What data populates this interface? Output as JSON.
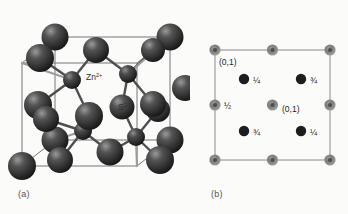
{
  "figure": {
    "background_color": "#fbfbfa"
  },
  "panel_a": {
    "caption": "(a)",
    "labels": {
      "cation": "Zn",
      "cation_charge": "2+",
      "anion": "S",
      "anion_charge": "2−"
    },
    "colors": {
      "sphere_dark": "#3a3a3a",
      "sphere_highlight": "#8e8e8e",
      "sphere_shadow": "#1b1b1b",
      "cell_edge": "#6f6f70",
      "bond": "#4a4a4a",
      "label_text": "#2e2e2e"
    },
    "cell_edges_visible": true,
    "corner_atoms": 8,
    "face_atoms": 6,
    "interior_atoms": 4
  },
  "panel_b": {
    "caption": "(b)",
    "colors": {
      "open_circle_ring": "#8c8c8c",
      "open_circle_core": "#5a5a5a",
      "filled_circle": "#1d1d1d",
      "square_edge": "#8a8a8a",
      "label_text": "#1d1d1d"
    },
    "square": {
      "note": "projected unit cell outline"
    },
    "open_sites": [
      {
        "position": "top-left-corner",
        "label": "(0,1)"
      },
      {
        "position": "top-middle-edge",
        "label": ""
      },
      {
        "position": "top-right-corner",
        "label": ""
      },
      {
        "position": "left-middle-edge",
        "label": "½"
      },
      {
        "position": "center",
        "label": "(0,1)"
      },
      {
        "position": "right-middle-edge",
        "label": ""
      },
      {
        "position": "bottom-left-corner",
        "label": ""
      },
      {
        "position": "bottom-middle-edge",
        "label": ""
      },
      {
        "position": "bottom-right-corner",
        "label": ""
      }
    ],
    "filled_sites": [
      {
        "position": "upper-left",
        "label": "¼"
      },
      {
        "position": "upper-right",
        "label": "¾"
      },
      {
        "position": "lower-left",
        "label": "¾"
      },
      {
        "position": "lower-right",
        "label": "¼"
      }
    ]
  }
}
